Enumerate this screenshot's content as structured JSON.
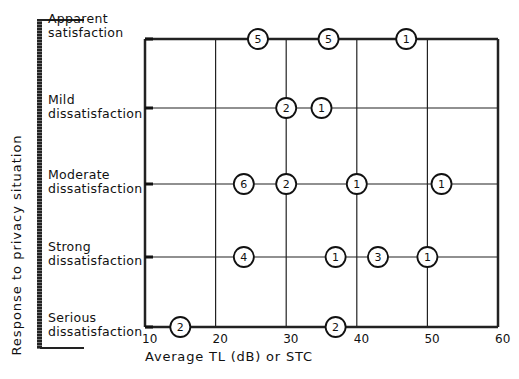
{
  "chart_data": {
    "type": "scatter",
    "title": "",
    "xlabel": "Average TL (dB) or STC",
    "ylabel": "Response to privacy situation",
    "xlim": [
      10,
      60
    ],
    "x_ticks": [
      "10",
      "20",
      "30",
      "40",
      "50",
      "60"
    ],
    "categories": [
      "Apparent satisfaction",
      "Mild dissatisfaction",
      "Moderate dissatisfaction",
      "Strong dissatisfaction",
      "Serious dissatisfaction"
    ],
    "grid": true,
    "points": [
      {
        "category": "Apparent satisfaction",
        "x": 26,
        "count": 5
      },
      {
        "category": "Apparent satisfaction",
        "x": 36,
        "count": 5
      },
      {
        "category": "Apparent satisfaction",
        "x": 47,
        "count": 1
      },
      {
        "category": "Mild dissatisfaction",
        "x": 30,
        "count": 2
      },
      {
        "category": "Mild dissatisfaction",
        "x": 35,
        "count": 1
      },
      {
        "category": "Moderate dissatisfaction",
        "x": 24,
        "count": 6
      },
      {
        "category": "Moderate dissatisfaction",
        "x": 30,
        "count": 2
      },
      {
        "category": "Moderate dissatisfaction",
        "x": 40,
        "count": 1
      },
      {
        "category": "Moderate dissatisfaction",
        "x": 52,
        "count": 1
      },
      {
        "category": "Strong dissatisfaction",
        "x": 24,
        "count": 4
      },
      {
        "category": "Strong dissatisfaction",
        "x": 37,
        "count": 1
      },
      {
        "category": "Strong dissatisfaction",
        "x": 43,
        "count": 3
      },
      {
        "category": "Strong dissatisfaction",
        "x": 50,
        "count": 1
      },
      {
        "category": "Serious dissatisfaction",
        "x": 15,
        "count": 2
      },
      {
        "category": "Serious dissatisfaction",
        "x": 37,
        "count": 2
      }
    ]
  },
  "labels": {
    "cat0_line1": "Apparent",
    "cat0_line2": "satisfaction",
    "cat1_line1": "Mild",
    "cat1_line2": "dissatisfaction",
    "cat2_line1": "Moderate",
    "cat2_line2": "dissatisfaction",
    "cat3_line1": "Strong",
    "cat3_line2": "dissatisfaction",
    "cat4_line1": "Serious",
    "cat4_line2": "dissatisfaction"
  }
}
